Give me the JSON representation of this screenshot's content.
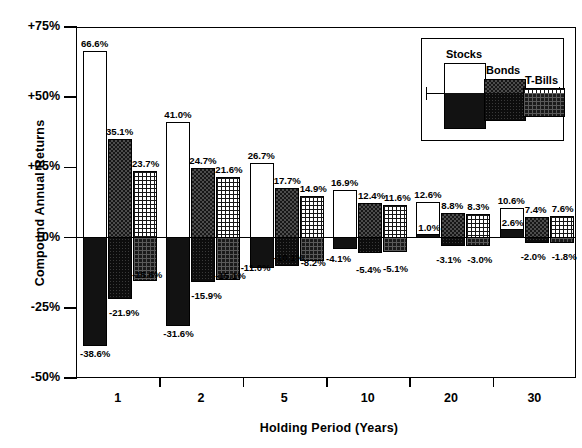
{
  "chart_data": {
    "type": "bar",
    "title": "",
    "xlabel": "Holding Period (Years)",
    "ylabel": "Compound Annual Returns",
    "categories": [
      "1",
      "2",
      "5",
      "10",
      "20",
      "30"
    ],
    "ylim": [
      -50,
      75
    ],
    "yticks": [
      "-50%",
      "-25%",
      "+0%",
      "+25%",
      "+50%",
      "+75%"
    ],
    "ytick_values": [
      -50,
      -25,
      0,
      25,
      50,
      75
    ],
    "grid": false,
    "legend_position": "top-right",
    "note": "Each asset shows a best (upper) and worst (lower) compound annual return for the given holding period.",
    "series": [
      {
        "name": "Stocks",
        "max": [
          66.6,
          41.0,
          26.7,
          16.9,
          12.6,
          10.6
        ],
        "min": [
          -38.6,
          -31.6,
          -11.0,
          -4.1,
          1.0,
          2.6
        ],
        "max_labels": [
          "66.6%",
          "41.0%",
          "26.7%",
          "16.9%",
          "12.6%",
          "10.6%"
        ],
        "min_labels": [
          "-38.6%",
          "-31.6%",
          "-11.0%",
          "-4.1%",
          "1.0%",
          "2.6%"
        ]
      },
      {
        "name": "Bonds",
        "max": [
          35.1,
          24.7,
          17.7,
          12.4,
          8.8,
          7.4
        ],
        "min": [
          -21.9,
          -15.9,
          -10.1,
          -5.4,
          -3.1,
          -2.0
        ],
        "max_labels": [
          "35.1%",
          "24.7%",
          "17.7%",
          "12.4%",
          "8.8%",
          "7.4%"
        ],
        "min_labels": [
          "-21.9%",
          "-15.9%",
          "-10.1%",
          "-5.4%",
          "-3.1%",
          "-2.0%"
        ]
      },
      {
        "name": "T-Bills",
        "max": [
          23.7,
          21.6,
          14.9,
          11.6,
          8.3,
          7.6
        ],
        "min": [
          -15.6,
          -15.1,
          -8.2,
          -5.1,
          -3.0,
          -1.8
        ],
        "max_labels": [
          "23.7%",
          "21.6%",
          "14.9%",
          "11.6%",
          "8.3%",
          "7.6%"
        ],
        "min_labels": [
          "-15.6%",
          "-15.1%",
          "-8.2%",
          "-5.1%",
          "-3.0%",
          "-1.8%"
        ]
      }
    ]
  },
  "legend": {
    "items": [
      {
        "label": "Stocks"
      },
      {
        "label": "Bonds"
      },
      {
        "label": "T-Bills"
      }
    ]
  },
  "colors": {
    "stocks_positive": "#ffffff",
    "stocks_negative": "#121212",
    "bonds": "#171717",
    "tbills": "#1a1a1a",
    "axis": "#000000",
    "background": "#ffffff"
  }
}
